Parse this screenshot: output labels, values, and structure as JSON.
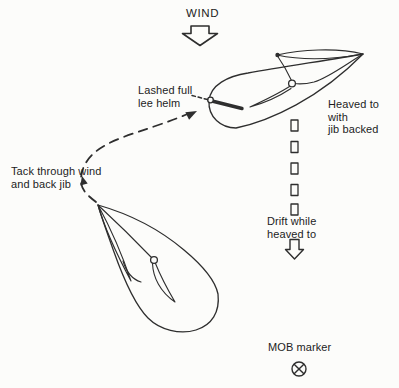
{
  "labels": {
    "wind": "WIND",
    "lashed_helm": "Lashed full\nlee helm",
    "heaved_to": "Heaved to with\njib backed",
    "tack": "Tack through wind\nand back jib",
    "drift": "Drift while\nheaved to",
    "mob_marker": "MOB marker"
  },
  "icons": {
    "wind_arrow": "block-arrow-down",
    "drift_arrow": "block-arrow-down",
    "mob_symbol": "circle-with-x",
    "tack_path": "dashed-curved-arrow",
    "drift_track": "dashed-rectangle-line"
  },
  "colors": {
    "line": "#2e2e2e",
    "text": "#1d1d1d",
    "background": "#fcfcfa"
  }
}
